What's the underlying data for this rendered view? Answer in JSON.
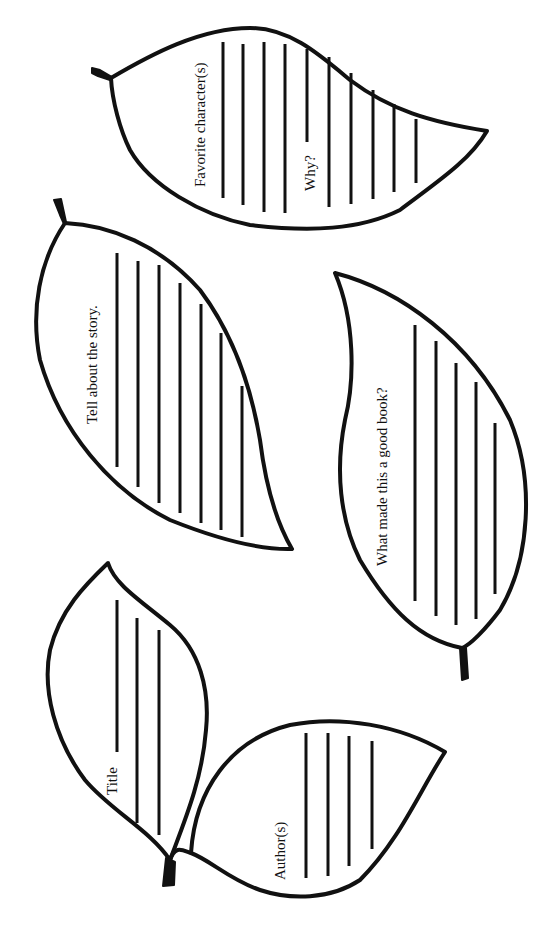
{
  "worksheet": {
    "background": "#ffffff",
    "ink_color": "#111111",
    "leaves": [
      {
        "id": "favorite-character",
        "prompts": [
          "Favorite character(s)",
          "Why?"
        ],
        "write_lines": 10
      },
      {
        "id": "tell-story",
        "prompts": [
          "Tell about the story."
        ],
        "write_lines": 7
      },
      {
        "id": "good-book",
        "prompts": [
          "What made this a good book?"
        ],
        "write_lines": 5
      },
      {
        "id": "title",
        "prompts": [
          "Title"
        ],
        "write_lines": 3
      },
      {
        "id": "authors",
        "prompts": [
          "Author(s)"
        ],
        "write_lines": 4
      }
    ]
  }
}
